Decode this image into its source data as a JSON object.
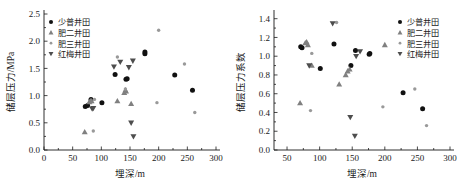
{
  "figure": {
    "panels": [
      {
        "id": "left-panel",
        "name": "reservoir-pressure-vs-depth",
        "axes": {
          "xlabel": "埋深/m",
          "ylabel": "储层压力/MPa",
          "xticks": [
            "0",
            "50",
            "100",
            "150",
            "200",
            "250",
            "300"
          ],
          "yticks": [
            "0.0",
            "0.5",
            "1.0",
            "1.5",
            "2.0",
            "2.5"
          ]
        },
        "legend": [
          {
            "label": "少普井田",
            "marker": "filled-circle",
            "color": "#111111"
          },
          {
            "label": "肥二井田",
            "marker": "triangle-up",
            "color": "#808080"
          },
          {
            "label": "肥三井田",
            "marker": "small-circle",
            "color": "#999999"
          },
          {
            "label": "红梅井田",
            "marker": "triangle-down",
            "color": "#4d4d4d"
          }
        ]
      },
      {
        "id": "right-panel",
        "name": "reservoir-pressure-coefficient-vs-depth",
        "axes": {
          "xlabel": "埋深/m",
          "ylabel": "储层压力系数",
          "xticks": [
            "50",
            "100",
            "150",
            "200",
            "250",
            "300"
          ],
          "yticks": [
            "0.0",
            "0.2",
            "0.4",
            "0.6",
            "0.8",
            "1.0",
            "1.2",
            "1.4"
          ]
        },
        "legend": [
          {
            "label": "少普井田",
            "marker": "filled-circle",
            "color": "#111111"
          },
          {
            "label": "肥二井田",
            "marker": "triangle-up",
            "color": "#808080"
          },
          {
            "label": "肥三井田",
            "marker": "small-circle",
            "color": "#999999"
          },
          {
            "label": "红梅井田",
            "marker": "triangle-down",
            "color": "#4d4d4d"
          }
        ]
      }
    ]
  },
  "chart_data": [
    {
      "type": "scatter",
      "title": "",
      "xlabel": "埋深/m",
      "ylabel": "储层压力/MPa",
      "xlim": [
        0,
        300
      ],
      "ylim": [
        0.0,
        2.5
      ],
      "xticks": [
        0,
        50,
        100,
        150,
        200,
        250,
        300
      ],
      "yticks": [
        0.0,
        0.5,
        1.0,
        1.5,
        2.0,
        2.5
      ],
      "grid": false,
      "legend_position": "top-left",
      "series": [
        {
          "name": "少普井田",
          "marker": "filled-circle",
          "color": "#111111",
          "points": [
            [
              72,
              0.8
            ],
            [
              76,
              0.82
            ],
            [
              82,
              0.93
            ],
            [
              101,
              0.87
            ],
            [
              124,
              1.39
            ],
            [
              143,
              1.3
            ],
            [
              145,
              1.31
            ],
            [
              176,
              1.77
            ],
            [
              176,
              1.8
            ],
            [
              228,
              1.38
            ],
            [
              259,
              1.1
            ]
          ]
        },
        {
          "name": "肥二井田",
          "marker": "triangle-up",
          "color": "#808080",
          "points": [
            [
              71,
              0.33
            ],
            [
              79,
              0.88
            ],
            [
              81,
              0.9
            ],
            [
              83,
              0.9
            ],
            [
              128,
              0.9
            ],
            [
              140,
              1.05
            ],
            [
              142,
              1.1
            ],
            [
              143,
              1.08
            ],
            [
              152,
              0.85
            ]
          ]
        },
        {
          "name": "肥三井田",
          "marker": "small-circle",
          "color": "#999999",
          "points": [
            [
              86,
              0.35
            ],
            [
              88,
              0.93
            ],
            [
              128,
              1.71
            ],
            [
              142,
              1.12
            ],
            [
              197,
              0.87
            ],
            [
              200,
              2.2
            ],
            [
              245,
              1.58
            ],
            [
              263,
              0.69
            ]
          ]
        },
        {
          "name": "红梅井田",
          "marker": "triangle-down",
          "color": "#4d4d4d",
          "points": [
            [
              84,
              0.76
            ],
            [
              86,
              0.77
            ],
            [
              122,
              1.53
            ],
            [
              133,
              1.62
            ],
            [
              148,
              1.52
            ],
            [
              155,
              1.64
            ],
            [
              152,
              0.5
            ],
            [
              156,
              0.25
            ]
          ]
        }
      ]
    },
    {
      "type": "scatter",
      "title": "",
      "xlabel": "埋深/m",
      "ylabel": "储层压力系数",
      "xlim": [
        30,
        300
      ],
      "ylim": [
        0.0,
        1.45
      ],
      "xticks": [
        50,
        100,
        150,
        200,
        250,
        300
      ],
      "yticks": [
        0.0,
        0.2,
        0.4,
        0.6,
        0.8,
        1.0,
        1.2,
        1.4
      ],
      "grid": false,
      "legend_position": "top-right",
      "series": [
        {
          "name": "少普井田",
          "marker": "filled-circle",
          "color": "#111111",
          "points": [
            [
              71,
              1.1
            ],
            [
              73,
              1.09
            ],
            [
              101,
              0.87
            ],
            [
              122,
              1.13
            ],
            [
              148,
              0.9
            ],
            [
              155,
              1.06
            ],
            [
              176,
              1.02
            ],
            [
              177,
              1.03
            ],
            [
              228,
              0.61
            ],
            [
              258,
              0.44
            ]
          ]
        },
        {
          "name": "肥二井田",
          "marker": "triangle-up",
          "color": "#808080",
          "points": [
            [
              70,
              0.5
            ],
            [
              78,
              1.14
            ],
            [
              80,
              1.15
            ],
            [
              82,
              1.12
            ],
            [
              88,
              0.9
            ],
            [
              130,
              0.7
            ],
            [
              140,
              0.8
            ],
            [
              143,
              0.84
            ],
            [
              146,
              0.86
            ],
            [
              200,
              1.12
            ]
          ]
        },
        {
          "name": "肥三井田",
          "marker": "small-circle",
          "color": "#999999",
          "points": [
            [
              86,
              0.42
            ],
            [
              88,
              1.03
            ],
            [
              126,
              1.36
            ],
            [
              197,
              0.46
            ],
            [
              246,
              0.65
            ],
            [
              264,
              0.26
            ]
          ]
        },
        {
          "name": "红梅井田",
          "marker": "triangle-down",
          "color": "#4d4d4d",
          "points": [
            [
              84,
              0.9
            ],
            [
              120,
              1.35
            ],
            [
              147,
              0.35
            ],
            [
              154,
              0.15
            ],
            [
              156,
              1.0
            ],
            [
              162,
              1.05
            ]
          ]
        }
      ]
    }
  ]
}
